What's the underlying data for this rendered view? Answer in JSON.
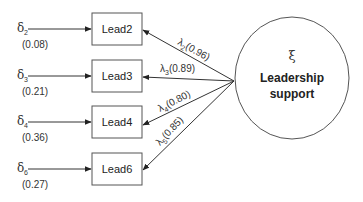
{
  "diagram": {
    "type": "confirmatory-factor-model",
    "latent": {
      "symbol": "ξ",
      "name_line1": "Leadership",
      "name_line2": "support"
    },
    "indicators": [
      {
        "label": "Lead2",
        "error_symbol": "δ",
        "error_sub": "2",
        "error_value": "(0.08)",
        "loading_symbol": "λ",
        "loading_sub": "2",
        "loading_value": "(0.96)"
      },
      {
        "label": "Lead3",
        "error_symbol": "δ",
        "error_sub": "3",
        "error_value": "(0.21)",
        "loading_symbol": "λ",
        "loading_sub": "3",
        "loading_value": "(0.89)"
      },
      {
        "label": "Lead4",
        "error_symbol": "δ",
        "error_sub": "4",
        "error_value": "(0.36)",
        "loading_symbol": "λ",
        "loading_sub": "4",
        "loading_value": "(0.80)"
      },
      {
        "label": "Lead6",
        "error_symbol": "δ",
        "error_sub": "6",
        "error_value": "(0.27)",
        "loading_symbol": "λ",
        "loading_sub": "5",
        "loading_value": "(0.85)"
      }
    ]
  }
}
